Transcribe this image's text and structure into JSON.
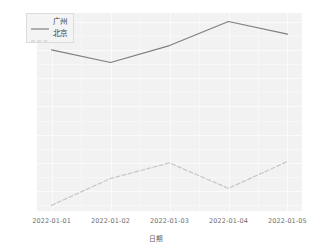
{
  "chart_data": {
    "type": "line",
    "title": "",
    "xlabel": "日期",
    "ylabel": "",
    "x": [
      "2022-01-01",
      "2022-01-02",
      "2022-01-03",
      "2022-01-04",
      "2022-01-05"
    ],
    "categories": [
      "2022-01-01",
      "2022-01-02",
      "2022-01-03",
      "2022-01-04",
      "2022-01-05"
    ],
    "series": [
      {
        "name": "广州",
        "values": [
          16.0,
          15.1,
          16.3,
          18.0,
          17.1
        ],
        "linestyle": "solid",
        "color": "#7f7f7f"
      },
      {
        "name": "北京",
        "values": [
          5.0,
          6.9,
          8.0,
          6.2,
          8.1
        ],
        "linestyle": "dashed",
        "color": "#c7c7c7"
      }
    ],
    "ylim": [
      4.6,
      18.6
    ],
    "yticks": [
      6,
      8,
      10,
      12,
      14,
      16,
      18
    ],
    "ytick_labels": [
      "6",
      "8",
      "10",
      "12",
      "14",
      "16",
      "18"
    ],
    "grid": true,
    "legend_position": "upper left",
    "panel_color": "#f2f2f2",
    "grid_color": "#fbfbfb"
  },
  "legend": {
    "items": [
      {
        "label": "广州"
      },
      {
        "label": "北京"
      }
    ]
  }
}
